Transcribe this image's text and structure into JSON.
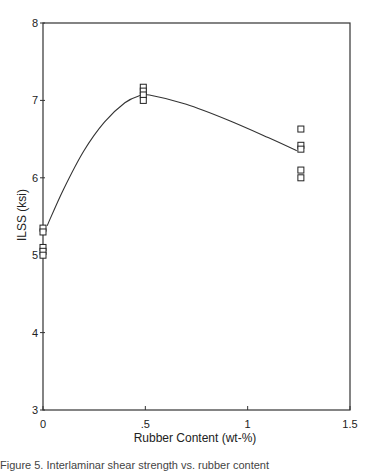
{
  "chart_data": {
    "type": "scatter",
    "title": "",
    "xlabel": "Rubber Content (wt-%)",
    "ylabel": "ILSS (ksi)",
    "xlim": [
      0,
      1.5
    ],
    "ylim": [
      3,
      8
    ],
    "xticks": [
      0,
      0.5,
      1,
      1.5
    ],
    "xtick_labels": [
      "0",
      ".5",
      "1",
      "1.5"
    ],
    "yticks": [
      3,
      4,
      5,
      6,
      7,
      8
    ],
    "ytick_labels": [
      "3",
      "4",
      "5",
      "6",
      "7",
      "8"
    ],
    "grid": false,
    "legend": null,
    "marker": "open-square",
    "series": [
      {
        "name": "ILSS measurements",
        "points": [
          {
            "x": 0,
            "y": 5.35
          },
          {
            "x": 0,
            "y": 5.3
          },
          {
            "x": 0,
            "y": 5.1
          },
          {
            "x": 0,
            "y": 5.05
          },
          {
            "x": 0,
            "y": 5.0
          },
          {
            "x": 0.49,
            "y": 7.17
          },
          {
            "x": 0.49,
            "y": 7.12
          },
          {
            "x": 0.49,
            "y": 7.07
          },
          {
            "x": 0.49,
            "y": 7.0
          },
          {
            "x": 1.26,
            "y": 6.63
          },
          {
            "x": 1.26,
            "y": 6.42
          },
          {
            "x": 1.26,
            "y": 6.37
          },
          {
            "x": 1.26,
            "y": 6.1
          },
          {
            "x": 1.26,
            "y": 6.0
          }
        ]
      }
    ],
    "fit_curve": {
      "name": "trend curve",
      "points": [
        {
          "x": 0.02,
          "y": 5.38
        },
        {
          "x": 0.1,
          "y": 5.85
        },
        {
          "x": 0.2,
          "y": 6.35
        },
        {
          "x": 0.3,
          "y": 6.72
        },
        {
          "x": 0.4,
          "y": 6.97
        },
        {
          "x": 0.47,
          "y": 7.06
        },
        {
          "x": 0.52,
          "y": 7.07
        },
        {
          "x": 0.7,
          "y": 6.95
        },
        {
          "x": 0.9,
          "y": 6.75
        },
        {
          "x": 1.1,
          "y": 6.52
        },
        {
          "x": 1.24,
          "y": 6.35
        }
      ]
    }
  },
  "caption": "Figure 5. Interlaminar shear strength vs. rubber content"
}
